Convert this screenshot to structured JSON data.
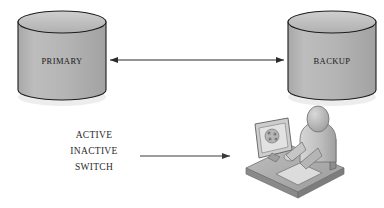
{
  "diagram": {
    "background_color": "#ffffff",
    "nodes": [
      {
        "id": "primary",
        "type": "database-cylinder",
        "label": "PRIMARY",
        "x": 18,
        "y": 10,
        "width": 88,
        "height": 90,
        "fill_color": "#b3b3b3",
        "stroke_color": "#1c1c1c",
        "top_fill_color": "#c2c2c2"
      },
      {
        "id": "backup",
        "type": "database-cylinder",
        "label": "BACKUP",
        "x": 288,
        "y": 10,
        "width": 88,
        "height": 90,
        "fill_color": "#b3b3b3",
        "stroke_color": "#1c1c1c",
        "top_fill_color": "#c2c2c2"
      },
      {
        "id": "workstation",
        "type": "person-at-computer-clipart",
        "x": 238,
        "y": 112,
        "width": 110,
        "height": 84
      }
    ],
    "connectors": [
      {
        "id": "replication-link",
        "from": "primary",
        "to": "backup",
        "direction": "bidirectional",
        "x1": 106,
        "y1": 60,
        "x2": 287,
        "y2": 60,
        "stroke_color": "#2b2b2b"
      },
      {
        "id": "switch-action-arrow",
        "from": "state-labels",
        "to": "workstation",
        "direction": "right",
        "x1": 140,
        "y1": 156,
        "x2": 232,
        "y2": 156,
        "stroke_color": "#3a3a3a"
      }
    ],
    "state_labels": [
      {
        "id": "state-active",
        "text": "ACTIVE",
        "x": 46,
        "y": 135
      },
      {
        "id": "state-inactive",
        "text": "INACTIVE",
        "x": 46,
        "y": 151
      },
      {
        "id": "state-switch",
        "text": "SWITCH",
        "x": 46,
        "y": 167
      }
    ]
  }
}
